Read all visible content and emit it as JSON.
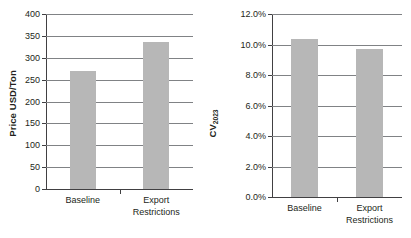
{
  "chart_data": [
    {
      "type": "bar",
      "title": "",
      "xlabel": "",
      "ylabel": "Price USD/Ton",
      "ylabel_plain": "Price USD/Ton",
      "categories": [
        "Baseline",
        "Export\nRestrictions"
      ],
      "values": [
        269,
        336
      ],
      "ylim": [
        0,
        400
      ],
      "ytick_values": [
        0,
        50,
        100,
        150,
        200,
        250,
        300,
        350,
        400
      ],
      "ytick_labels": [
        "0",
        "50",
        "100",
        "150",
        "200",
        "250",
        "300",
        "350",
        "400"
      ],
      "grid": true,
      "grid_axis": "y",
      "legend": false,
      "bar_color": "#b7b7b7",
      "axis_color": "#414042",
      "grid_color": "#808285"
    },
    {
      "type": "bar",
      "title": "",
      "xlabel": "",
      "ylabel_base": "CV",
      "ylabel_sub": "2023",
      "ylabel_plain": "CV2023",
      "categories": [
        "Baseline",
        "Export Restrictions"
      ],
      "values": [
        10.35,
        9.7
      ],
      "value_unit": "%",
      "ylim": [
        0,
        12
      ],
      "ytick_values": [
        0,
        2,
        4,
        6,
        8,
        10,
        12
      ],
      "ytick_labels": [
        "0.0%",
        "2.0%",
        "4.0%",
        "6.0%",
        "8.0%",
        "10.0%",
        "12.0%"
      ],
      "grid": true,
      "grid_axis": "y",
      "legend": false,
      "bar_color": "#b7b7b7",
      "axis_color": "#414042",
      "grid_color": "#808285"
    }
  ],
  "left_chart": {
    "y_title": "Price USD/Ton",
    "y_ticks": [
      {
        "label": "400"
      },
      {
        "label": "350"
      },
      {
        "label": "300"
      },
      {
        "label": "250"
      },
      {
        "label": "200"
      },
      {
        "label": "150"
      },
      {
        "label": "100"
      },
      {
        "label": "50"
      },
      {
        "label": "0"
      }
    ],
    "bars": [
      {
        "label": "Baseline",
        "value": 269
      },
      {
        "label": "Export\nRestrictions",
        "value": 336
      }
    ]
  },
  "right_chart": {
    "y_title_base": "CV",
    "y_title_sub": "2023",
    "y_ticks": [
      {
        "label": "12.0%"
      },
      {
        "label": "10.0%"
      },
      {
        "label": "8.0%"
      },
      {
        "label": "6.0%"
      },
      {
        "label": "4.0%"
      },
      {
        "label": "2.0%"
      },
      {
        "label": "0.0%"
      }
    ],
    "bars": [
      {
        "label": "Baseline",
        "value": 10.35
      },
      {
        "label": "Export Restrictions",
        "value": 9.7
      }
    ]
  }
}
